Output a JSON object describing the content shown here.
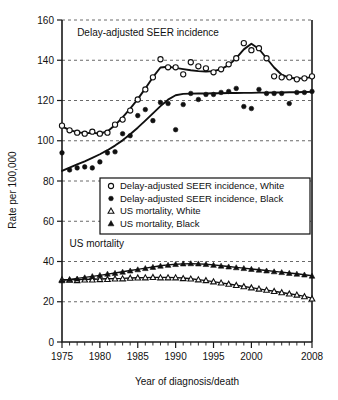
{
  "chart_data": {
    "type": "line",
    "title": "",
    "xlabel": "Year of diagnosis/death",
    "ylabel": "Rate per 100,000",
    "xlim": [
      1975,
      2008
    ],
    "ylim": [
      0,
      160
    ],
    "ytick_step": 20,
    "xtick_step": 5,
    "grid": true,
    "legend_position": "center",
    "xticks": [
      "1975",
      "1980",
      "1985",
      "1990",
      "1995",
      "2000",
      "2008"
    ],
    "xtick_values": [
      1975,
      1980,
      1985,
      1990,
      1995,
      2000,
      2008
    ],
    "yticks": [
      "0",
      "20",
      "40",
      "60",
      "80",
      "100",
      "120",
      "140",
      "160"
    ],
    "ytick_values": [
      0,
      20,
      40,
      60,
      80,
      100,
      120,
      140,
      160
    ],
    "annotations": [
      {
        "text": "Delay-adjusted SEER incidence",
        "x": 1977.0,
        "y": 152.0
      },
      {
        "text": "US mortality",
        "x": 1976.0,
        "y": 47.0
      }
    ],
    "x": [
      1975,
      1976,
      1977,
      1978,
      1979,
      1980,
      1981,
      1982,
      1983,
      1984,
      1985,
      1986,
      1987,
      1988,
      1989,
      1990,
      1991,
      1992,
      1993,
      1994,
      1995,
      1996,
      1997,
      1998,
      1999,
      2000,
      2001,
      2002,
      2003,
      2004,
      2005,
      2006,
      2007,
      2008
    ],
    "series": [
      {
        "name": "Delay-adjusted SEER incidence, White",
        "marker": "open-circle",
        "values": [
          107.5,
          105.2,
          104.0,
          103.5,
          104.5,
          103.5,
          104.0,
          108.0,
          110.5,
          115.0,
          120.5,
          125.5,
          131.5,
          140.5,
          136.5,
          136.5,
          133.0,
          139.0,
          137.0,
          136.0,
          134.0,
          135.5,
          138.0,
          141.0,
          148.5,
          145.0,
          146.0,
          141.0,
          132.0,
          131.5,
          131.5,
          130.5,
          131.0,
          132.0
        ],
        "trend": [
          107.0,
          105.4,
          104.2,
          103.8,
          103.9,
          103.6,
          104.6,
          107.8,
          111.6,
          116.0,
          120.7,
          126.0,
          131.6,
          136.4,
          136.8,
          136.2,
          135.6,
          135.0,
          134.6,
          134.4,
          134.6,
          135.6,
          137.6,
          141.0,
          145.4,
          148.2,
          145.6,
          141.0,
          136.4,
          132.8,
          131.3,
          130.9,
          131.1,
          131.6
        ]
      },
      {
        "name": "Delay-adjusted SEER incidence, Black",
        "marker": "solid-circle",
        "values": [
          94.0,
          85.5,
          86.5,
          87.0,
          86.5,
          89.5,
          94.0,
          94.5,
          103.5,
          102.5,
          112.5,
          115.5,
          110.0,
          119.0,
          118.5,
          105.5,
          118.0,
          123.5,
          120.5,
          123.0,
          123.0,
          124.0,
          124.5,
          126.0,
          117.0,
          116.0,
          125.5,
          123.5,
          123.5,
          123.5,
          118.5,
          124.0,
          124.0,
          124.5
        ],
        "trend": [
          85.0,
          86.6,
          88.2,
          89.8,
          91.5,
          93.3,
          95.3,
          97.6,
          100.2,
          103.2,
          106.5,
          110.0,
          113.6,
          117.2,
          120.4,
          122.6,
          123.3,
          123.4,
          123.5,
          123.5,
          123.6,
          123.6,
          123.7,
          123.7,
          123.8,
          123.8,
          123.9,
          123.9,
          124.0,
          124.0,
          124.1,
          124.1,
          124.2,
          124.3
        ]
      },
      {
        "name": "US mortality, White",
        "marker": "open-triangle",
        "values": [
          31.0,
          30.8,
          30.6,
          30.9,
          30.9,
          31.1,
          31.2,
          31.4,
          31.5,
          31.8,
          31.9,
          32.0,
          32.2,
          32.0,
          32.0,
          32.0,
          31.6,
          31.4,
          31.0,
          30.6,
          30.0,
          29.4,
          28.8,
          28.2,
          27.6,
          27.0,
          26.4,
          25.8,
          25.2,
          24.6,
          24.0,
          23.4,
          22.6,
          21.5
        ],
        "trend": [
          30.9,
          30.9,
          31.0,
          31.1,
          31.2,
          31.3,
          31.4,
          31.5,
          31.6,
          31.8,
          31.9,
          32.0,
          32.1,
          32.1,
          32.1,
          32.0,
          31.8,
          31.4,
          31.0,
          30.5,
          30.0,
          29.4,
          28.8,
          28.2,
          27.6,
          27.0,
          26.4,
          25.8,
          25.2,
          24.6,
          24.0,
          23.4,
          22.7,
          21.8
        ]
      },
      {
        "name": "US mortality, Black",
        "marker": "solid-triangle",
        "values": [
          30.5,
          31.0,
          31.4,
          32.0,
          32.6,
          33.2,
          33.8,
          34.2,
          34.8,
          35.4,
          36.0,
          36.6,
          37.2,
          37.8,
          38.2,
          38.6,
          38.9,
          39.0,
          38.9,
          38.6,
          38.2,
          37.8,
          37.4,
          37.0,
          36.6,
          36.2,
          35.8,
          35.4,
          35.0,
          34.6,
          34.2,
          33.8,
          33.4,
          32.8
        ],
        "trend": [
          30.6,
          31.1,
          31.6,
          32.1,
          32.6,
          33.1,
          33.7,
          34.3,
          34.9,
          35.5,
          36.1,
          36.7,
          37.3,
          37.9,
          38.3,
          38.6,
          38.8,
          38.9,
          38.8,
          38.6,
          38.3,
          37.9,
          37.5,
          37.1,
          36.7,
          36.3,
          35.9,
          35.5,
          35.1,
          34.7,
          34.3,
          33.9,
          33.4,
          32.9
        ]
      }
    ]
  },
  "legend": {
    "entries": [
      {
        "label": "Delay-adjusted SEER incidence, White",
        "marker": "open-circle"
      },
      {
        "label": "Delay-adjusted SEER incidence, Black",
        "marker": "solid-circle"
      },
      {
        "label": "US mortality, White",
        "marker": "open-triangle"
      },
      {
        "label": "US mortality, Black",
        "marker": "solid-triangle"
      }
    ]
  },
  "colors": {
    "ink": "#101010",
    "grid": "#444444",
    "background": "#ffffff"
  }
}
